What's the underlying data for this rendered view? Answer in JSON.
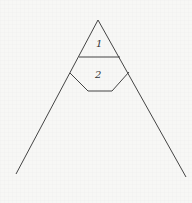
{
  "diagram": {
    "type": "triangle-with-regions",
    "regions": [
      {
        "id": 1,
        "label": "1"
      },
      {
        "id": 2,
        "label": "2"
      }
    ],
    "stroke_color": "#444444",
    "background": "#f7f7f5",
    "apex": [
      98,
      20
    ],
    "left_foot": [
      16,
      174
    ],
    "right_foot": [
      186,
      177
    ],
    "divider_line": [
      [
        79,
        57
      ],
      [
        120,
        57
      ]
    ],
    "lower_region_path": [
      [
        70,
        73
      ],
      [
        88,
        91
      ],
      [
        112,
        91
      ],
      [
        129,
        72
      ]
    ]
  }
}
